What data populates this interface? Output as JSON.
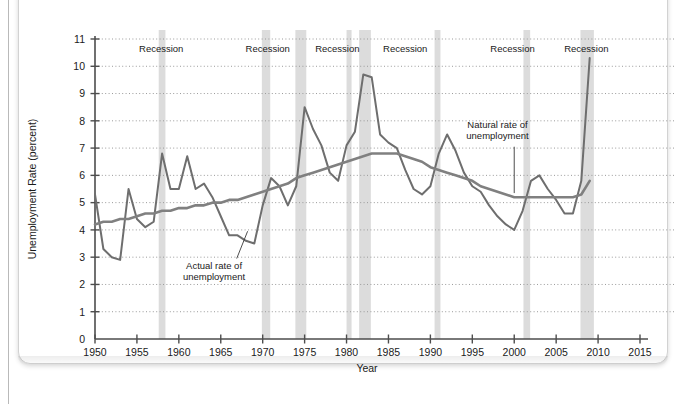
{
  "chart_data": {
    "type": "line",
    "title": "",
    "xlabel": "Year",
    "ylabel": "Unemployment Rate (percent)",
    "xlim": [
      1950,
      2015
    ],
    "ylim": [
      0,
      11
    ],
    "xticks": [
      1950,
      1955,
      1960,
      1965,
      1970,
      1975,
      1980,
      1985,
      1990,
      1995,
      2000,
      2005,
      2010,
      2015
    ],
    "yticks": [
      0,
      1,
      2,
      3,
      4,
      5,
      6,
      7,
      8,
      9,
      10,
      11
    ],
    "grid": "horizontal-dotted",
    "legend": "annotations",
    "x": [
      1950,
      1951,
      1952,
      1953,
      1954,
      1955,
      1956,
      1957,
      1958,
      1959,
      1960,
      1961,
      1962,
      1963,
      1964,
      1965,
      1966,
      1967,
      1968,
      1969,
      1970,
      1971,
      1972,
      1973,
      1974,
      1975,
      1976,
      1977,
      1978,
      1979,
      1980,
      1981,
      1982,
      1983,
      1984,
      1985,
      1986,
      1987,
      1988,
      1989,
      1990,
      1991,
      1992,
      1993,
      1994,
      1995,
      1996,
      1997,
      1998,
      1999,
      2000,
      2001,
      2002,
      2003,
      2004,
      2005,
      2006,
      2007,
      2008,
      2009
    ],
    "series": [
      {
        "name": "Actual rate of unemployment",
        "color": "#6e6e6e",
        "values": [
          5.3,
          3.3,
          3.0,
          2.9,
          5.5,
          4.4,
          4.1,
          4.3,
          6.8,
          5.5,
          5.5,
          6.7,
          5.5,
          5.7,
          5.2,
          4.5,
          3.8,
          3.8,
          3.6,
          3.5,
          4.9,
          5.9,
          5.6,
          4.9,
          5.6,
          8.5,
          7.7,
          7.1,
          6.1,
          5.8,
          7.1,
          7.6,
          9.7,
          9.6,
          7.5,
          7.2,
          7.0,
          6.2,
          5.5,
          5.3,
          5.6,
          6.8,
          7.5,
          6.9,
          6.1,
          5.6,
          5.4,
          4.9,
          4.5,
          4.2,
          4.0,
          4.7,
          5.8,
          6.0,
          5.5,
          5.1,
          4.6,
          4.6,
          5.8,
          10.3
        ]
      },
      {
        "name": "Natural rate of unemployment",
        "color": "#808080",
        "values": [
          4.2,
          4.3,
          4.3,
          4.4,
          4.4,
          4.5,
          4.6,
          4.6,
          4.7,
          4.7,
          4.8,
          4.8,
          4.9,
          4.9,
          5.0,
          5.0,
          5.1,
          5.1,
          5.2,
          5.3,
          5.4,
          5.5,
          5.6,
          5.7,
          5.9,
          6.0,
          6.1,
          6.2,
          6.3,
          6.4,
          6.5,
          6.6,
          6.7,
          6.8,
          6.8,
          6.8,
          6.8,
          6.7,
          6.6,
          6.5,
          6.3,
          6.2,
          6.1,
          6.0,
          5.9,
          5.8,
          5.6,
          5.5,
          5.4,
          5.3,
          5.2,
          5.2,
          5.2,
          5.2,
          5.2,
          5.2,
          5.2,
          5.2,
          5.3,
          5.8
        ]
      }
    ],
    "recessions": [
      {
        "label": "Recession",
        "start": 1957.6,
        "end": 1958.4
      },
      {
        "label": "Recession",
        "start": 1969.9,
        "end": 1970.9
      },
      {
        "label": "Recession",
        "start": 1973.9,
        "end": 1975.2
      },
      {
        "label": "Recession",
        "start": 1980.0,
        "end": 1980.6
      },
      {
        "label": "Recession",
        "start": 1981.5,
        "end": 1982.9
      },
      {
        "label": "Recession",
        "start": 1990.5,
        "end": 1991.2
      },
      {
        "label": "Recession",
        "start": 2001.1,
        "end": 2001.9
      },
      {
        "label": "Recession",
        "start": 2007.9,
        "end": 2009.5
      }
    ],
    "recession_labels": [
      {
        "text": "Recession",
        "x": 1957.9
      },
      {
        "text": "Recession",
        "x": 1970.6
      },
      {
        "text": "Recession",
        "x": 1978.9
      },
      {
        "text": "Recession",
        "x": 1987.0
      },
      {
        "text": "Recession",
        "x": 1999.8
      },
      {
        "text": "Recession",
        "x": 2008.6
      }
    ],
    "annotations": [
      {
        "name": "actual-rate-annotation",
        "line1": "Actual rate of",
        "line2": "unemployment",
        "text_x": 1964.2,
        "text_y": 2.55,
        "leader_from_x": 1966.9,
        "leader_from_y": 2.95,
        "leader_to_x": 1968.2,
        "leader_to_y": 3.95
      },
      {
        "name": "natural-rate-annotation",
        "line1": "Natural rate of",
        "line2": "unemployment",
        "text_x": 1998.0,
        "text_y": 7.75,
        "leader_from_x": 2000.0,
        "leader_from_y": 7.05,
        "leader_to_x": 2000.0,
        "leader_to_y": 5.35
      }
    ]
  },
  "style": {
    "axis_color": "#4d4d4d",
    "grid_color": "#9a9a9a",
    "recession_band_color": "#dcdcdc",
    "text_color": "#1a1a1a"
  }
}
